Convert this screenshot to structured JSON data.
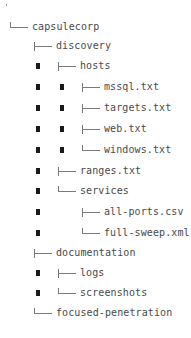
{
  "tree": {
    "root_marker": ".",
    "colors": {
      "text": "#4a4a4a",
      "connector": "#7a7a7a",
      "depth_marker": "#1a1a1a"
    },
    "nodes": [
      {
        "label": "capsulecorp",
        "depth": 0,
        "connector": "elbow",
        "type": "directory"
      },
      {
        "label": "discovery",
        "depth": 1,
        "connector": "tee",
        "type": "directory"
      },
      {
        "label": "hosts",
        "depth": 2,
        "connector": "tee",
        "type": "directory"
      },
      {
        "label": "mssql.txt",
        "depth": 3,
        "connector": "tee",
        "type": "file"
      },
      {
        "label": "targets.txt",
        "depth": 3,
        "connector": "tee",
        "type": "file"
      },
      {
        "label": "web.txt",
        "depth": 3,
        "connector": "tee",
        "type": "file"
      },
      {
        "label": "windows.txt",
        "depth": 3,
        "connector": "elbow",
        "type": "file"
      },
      {
        "label": "ranges.txt",
        "depth": 2,
        "connector": "tee",
        "type": "file"
      },
      {
        "label": "services",
        "depth": 2,
        "connector": "elbow",
        "type": "directory"
      },
      {
        "label": "all-ports.csv",
        "depth": 3,
        "connector": "tee",
        "type": "file"
      },
      {
        "label": "full-sweep.xml",
        "depth": 3,
        "connector": "elbow",
        "type": "file"
      },
      {
        "label": "documentation",
        "depth": 1,
        "connector": "tee",
        "type": "directory"
      },
      {
        "label": "logs",
        "depth": 2,
        "connector": "tee",
        "type": "directory"
      },
      {
        "label": "screenshots",
        "depth": 2,
        "connector": "elbow",
        "type": "directory"
      },
      {
        "label": "focused-penetration",
        "depth": 1,
        "connector": "elbow",
        "type": "directory"
      }
    ]
  }
}
